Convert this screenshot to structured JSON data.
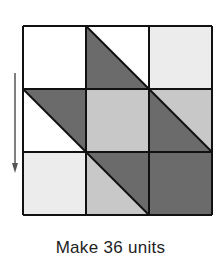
{
  "diagram": {
    "grid": {
      "rows": 3,
      "cols": 3,
      "x": 23,
      "y": 26,
      "cell": 63
    },
    "colors": {
      "white": "#ffffff",
      "very_light": "#ececec",
      "medium_light": "#c8c8c8",
      "dark": "#6b6b6b",
      "line": "#111111",
      "arrow": "#555555"
    },
    "cells": [
      {
        "row": 0,
        "col": 0,
        "type": "solid",
        "fill": "white"
      },
      {
        "row": 0,
        "col": 1,
        "type": "hst",
        "lower_left": "dark",
        "upper_right": "white"
      },
      {
        "row": 0,
        "col": 2,
        "type": "solid",
        "fill": "very_light"
      },
      {
        "row": 1,
        "col": 0,
        "type": "hst",
        "lower_left": "white",
        "upper_right": "dark"
      },
      {
        "row": 1,
        "col": 1,
        "type": "solid",
        "fill": "medium_light"
      },
      {
        "row": 1,
        "col": 2,
        "type": "hst",
        "lower_left": "dark",
        "upper_right": "medium_light"
      },
      {
        "row": 2,
        "col": 0,
        "type": "solid",
        "fill": "very_light"
      },
      {
        "row": 2,
        "col": 1,
        "type": "hst",
        "lower_left": "medium_light",
        "upper_right": "dark"
      },
      {
        "row": 2,
        "col": 2,
        "type": "solid",
        "fill": "dark"
      }
    ],
    "arrow": {
      "direction": "down",
      "x": 15,
      "y1": 73,
      "y2": 173
    }
  },
  "caption": "Make 36 units"
}
